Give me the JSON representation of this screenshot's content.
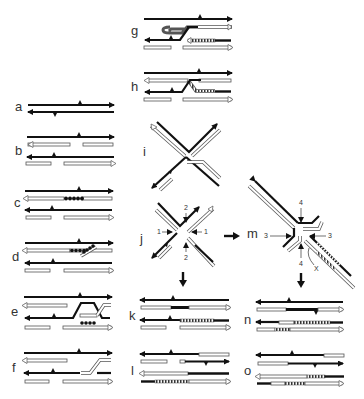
{
  "figure": {
    "colors": {
      "black_strand": "#111111",
      "white_strand_fill": "#ffffff",
      "white_strand_edge": "#555555",
      "background": "#ffffff"
    },
    "panels": [
      {
        "id": "a",
        "label": "a"
      },
      {
        "id": "b",
        "label": "b"
      },
      {
        "id": "c",
        "label": "c"
      },
      {
        "id": "d",
        "label": "d"
      },
      {
        "id": "e",
        "label": "e"
      },
      {
        "id": "f",
        "label": "f"
      },
      {
        "id": "g",
        "label": "g"
      },
      {
        "id": "h",
        "label": "h"
      },
      {
        "id": "i",
        "label": "i"
      },
      {
        "id": "j",
        "label": "j"
      },
      {
        "id": "k",
        "label": "k"
      },
      {
        "id": "l",
        "label": "l"
      },
      {
        "id": "m",
        "label": "m"
      },
      {
        "id": "n",
        "label": "n"
      },
      {
        "id": "o",
        "label": "o"
      }
    ],
    "annotations": {
      "j_arrow_left": "1",
      "j_arrow_right": "1",
      "j_arrow_top": "2",
      "j_arrow_bottom": "2",
      "m_arrow_left": "3",
      "m_arrow_right": "3",
      "m_arrow_top": "4",
      "m_arrow_bottom": "4",
      "m_crossover": "X"
    }
  }
}
